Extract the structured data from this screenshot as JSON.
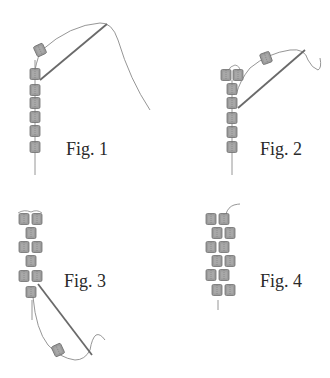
{
  "figures": [
    {
      "id": 1,
      "label": "Fig. 1"
    },
    {
      "id": 2,
      "label": "Fig. 2"
    },
    {
      "id": 3,
      "label": "Fig. 3"
    },
    {
      "id": 4,
      "label": "Fig. 4"
    }
  ],
  "colors": {
    "bead_fill": "#9c9c9c",
    "bead_stroke": "#6e6e6e",
    "bead_inner": "#b8b8b8",
    "thread": "#8a8a8a",
    "needle": "#6a6a6a",
    "background": "#ffffff"
  }
}
